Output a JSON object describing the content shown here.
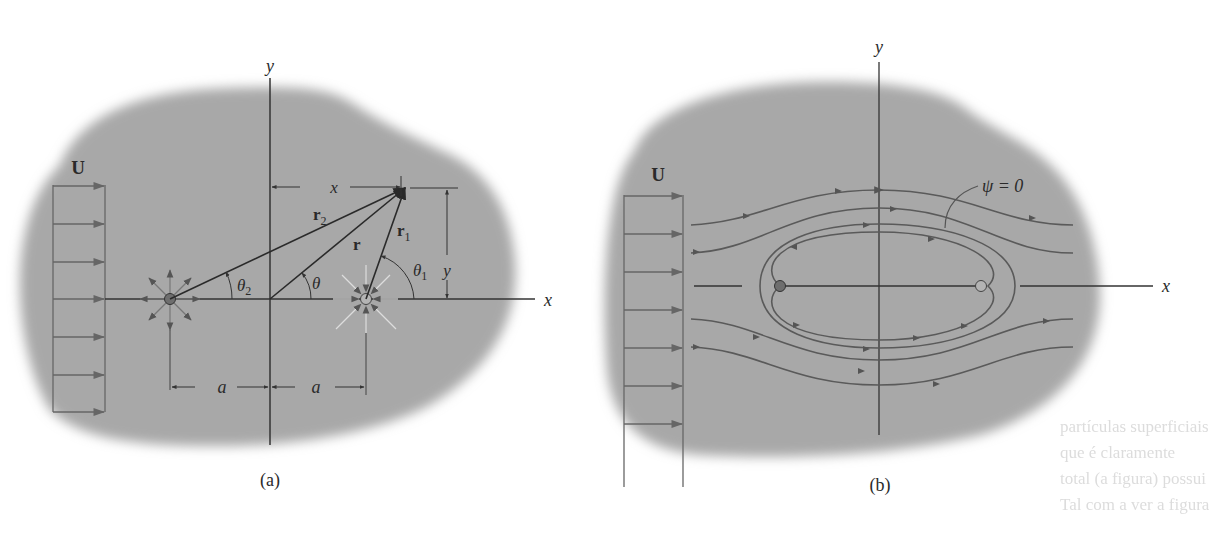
{
  "figure": {
    "panel_a": {
      "caption": "(a)",
      "uniform_flow_label": "U",
      "axis_x_label": "x",
      "axis_y_label": "y",
      "dimension_x_label": "x",
      "dimension_y_label": "y",
      "vector_r_label": "r",
      "vector_r1_label": "r",
      "vector_r1_sub": "1",
      "vector_r2_label": "r",
      "vector_r2_sub": "2",
      "angle_theta_label": "θ",
      "angle_theta1_label": "θ",
      "angle_theta1_sub": "1",
      "angle_theta2_label": "θ",
      "angle_theta2_sub": "2",
      "spacing_left_label": "a",
      "spacing_right_label": "a",
      "source_desc": "source",
      "sink_desc": "sink"
    },
    "panel_b": {
      "caption": "(b)",
      "uniform_flow_label": "U",
      "axis_x_label": "x",
      "axis_y_label": "y",
      "dividing_streamline_label": "ψ = 0"
    },
    "background_text": [
      "partículas superficiais",
      "que é claramente",
      "total (a figura) possui",
      "Tal com a ver a figura"
    ],
    "colors": {
      "region_fill": "#a6a6a6",
      "line": "#3a3a3a",
      "streamline": "#555555",
      "source_dot": "#6e6e6e",
      "sink_dot": "#b4b4b4"
    }
  }
}
